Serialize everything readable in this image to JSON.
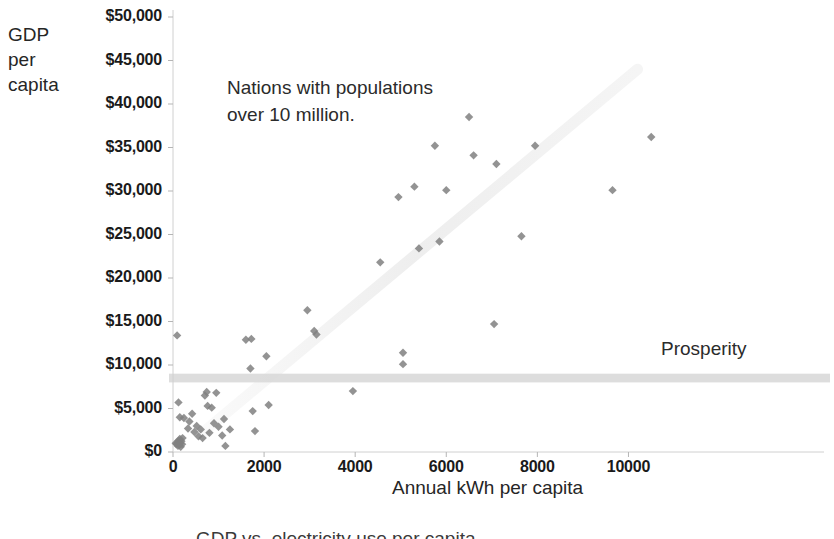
{
  "chart_data": {
    "type": "scatter",
    "title": "",
    "xlabel": "Annual kWh per capita",
    "ylabel": "GDP per capita",
    "ylabel_lines": [
      "GDP",
      "per",
      "capita"
    ],
    "xlim": [
      0,
      11000
    ],
    "ylim": [
      0,
      50000
    ],
    "xticks": [
      0,
      2000,
      4000,
      6000,
      8000,
      10000
    ],
    "xtick_labels": [
      "0",
      "2000",
      "4000",
      "6000",
      "8000",
      "10000"
    ],
    "yticks": [
      0,
      5000,
      10000,
      15000,
      20000,
      25000,
      30000,
      35000,
      40000,
      45000,
      50000
    ],
    "ytick_labels": [
      "$0",
      "$5,000",
      "$10,000",
      "$15,000",
      "$20,000",
      "$25,000",
      "$30,000",
      "$35,000",
      "$40,000",
      "$45,000",
      "$50,000"
    ],
    "grid": false,
    "legend": "none",
    "marker": "diamond",
    "marker_color": "#808080",
    "annotations": [
      {
        "name": "population-note",
        "text": "Nations with populations over 10 million.",
        "lines": [
          "Nations with populations",
          "over 10 million."
        ],
        "x": 1200,
        "y": 42000
      },
      {
        "name": "prosperity-label",
        "text": "Prosperity",
        "x": 10700,
        "y": 12800
      }
    ],
    "prosperity_band": {
      "label": "Prosperity",
      "y_low": 8000,
      "y_high": 9000,
      "color": "#d9d9d9"
    },
    "trend_band": {
      "description": "faint diagonal trend shading from lower-left to upper-right",
      "color": "#ebebeb",
      "x_start": 600,
      "y_start": 2000,
      "x_end": 10200,
      "y_end": 44000
    },
    "points": [
      {
        "x": 60,
        "y": 1000
      },
      {
        "x": 80,
        "y": 900
      },
      {
        "x": 100,
        "y": 1100
      },
      {
        "x": 110,
        "y": 700
      },
      {
        "x": 120,
        "y": 1300
      },
      {
        "x": 140,
        "y": 800
      },
      {
        "x": 150,
        "y": 1500
      },
      {
        "x": 160,
        "y": 1000
      },
      {
        "x": 170,
        "y": 600
      },
      {
        "x": 185,
        "y": 1250
      },
      {
        "x": 200,
        "y": 900
      },
      {
        "x": 210,
        "y": 1600
      },
      {
        "x": 90,
        "y": 13400
      },
      {
        "x": 120,
        "y": 5700
      },
      {
        "x": 150,
        "y": 4000
      },
      {
        "x": 240,
        "y": 3900
      },
      {
        "x": 330,
        "y": 2700
      },
      {
        "x": 360,
        "y": 3500
      },
      {
        "x": 420,
        "y": 4400
      },
      {
        "x": 470,
        "y": 2300
      },
      {
        "x": 520,
        "y": 3000
      },
      {
        "x": 560,
        "y": 1800
      },
      {
        "x": 610,
        "y": 2600
      },
      {
        "x": 650,
        "y": 1600
      },
      {
        "x": 700,
        "y": 6500
      },
      {
        "x": 740,
        "y": 6900
      },
      {
        "x": 760,
        "y": 5300
      },
      {
        "x": 800,
        "y": 2200
      },
      {
        "x": 850,
        "y": 5100
      },
      {
        "x": 900,
        "y": 3300
      },
      {
        "x": 950,
        "y": 6800
      },
      {
        "x": 1000,
        "y": 2900
      },
      {
        "x": 1080,
        "y": 1900
      },
      {
        "x": 1120,
        "y": 3800
      },
      {
        "x": 1150,
        "y": 700
      },
      {
        "x": 1250,
        "y": 2600
      },
      {
        "x": 1600,
        "y": 12900
      },
      {
        "x": 1720,
        "y": 13000
      },
      {
        "x": 1700,
        "y": 9600
      },
      {
        "x": 1750,
        "y": 4700
      },
      {
        "x": 1800,
        "y": 2400
      },
      {
        "x": 2050,
        "y": 11000
      },
      {
        "x": 2100,
        "y": 5400
      },
      {
        "x": 2950,
        "y": 16300
      },
      {
        "x": 3100,
        "y": 13900
      },
      {
        "x": 3150,
        "y": 13500
      },
      {
        "x": 3950,
        "y": 7000
      },
      {
        "x": 4550,
        "y": 21800
      },
      {
        "x": 4950,
        "y": 29300
      },
      {
        "x": 5050,
        "y": 11400
      },
      {
        "x": 5050,
        "y": 10100
      },
      {
        "x": 5300,
        "y": 30500
      },
      {
        "x": 5400,
        "y": 23400
      },
      {
        "x": 5750,
        "y": 35200
      },
      {
        "x": 5850,
        "y": 24200
      },
      {
        "x": 6000,
        "y": 30100
      },
      {
        "x": 6500,
        "y": 38500
      },
      {
        "x": 6600,
        "y": 34100
      },
      {
        "x": 7050,
        "y": 14700
      },
      {
        "x": 7100,
        "y": 33100
      },
      {
        "x": 7650,
        "y": 24800
      },
      {
        "x": 7950,
        "y": 35200
      },
      {
        "x": 9650,
        "y": 30100
      },
      {
        "x": 10500,
        "y": 36200
      }
    ]
  },
  "footer": {
    "cut_off_text": "GDP vs. electricity use per capita"
  }
}
